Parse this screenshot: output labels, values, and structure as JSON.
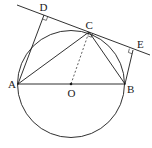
{
  "diagram": {
    "type": "geometry",
    "colors": {
      "stroke": "#1a1a1a",
      "background": "#ffffff"
    },
    "circle": {
      "center": "O",
      "cx": 71,
      "cy": 84,
      "r": 53.5
    },
    "points": {
      "A": {
        "label": "A",
        "x": 18,
        "y": 84
      },
      "B": {
        "label": "B",
        "x": 125,
        "y": 84
      },
      "O": {
        "label": "O",
        "x": 71,
        "y": 84
      },
      "C": {
        "label": "C",
        "x": 89,
        "y": 32
      },
      "D": {
        "label": "D",
        "x": 44,
        "y": 15
      },
      "E": {
        "label": "E",
        "x": 133,
        "y": 50
      }
    },
    "segments": [
      "AB",
      "AC",
      "BC",
      "AD",
      "BE",
      "DE (tangent line)",
      "OC (dashed)"
    ],
    "right_angles": [
      "D",
      "E",
      "C"
    ]
  }
}
